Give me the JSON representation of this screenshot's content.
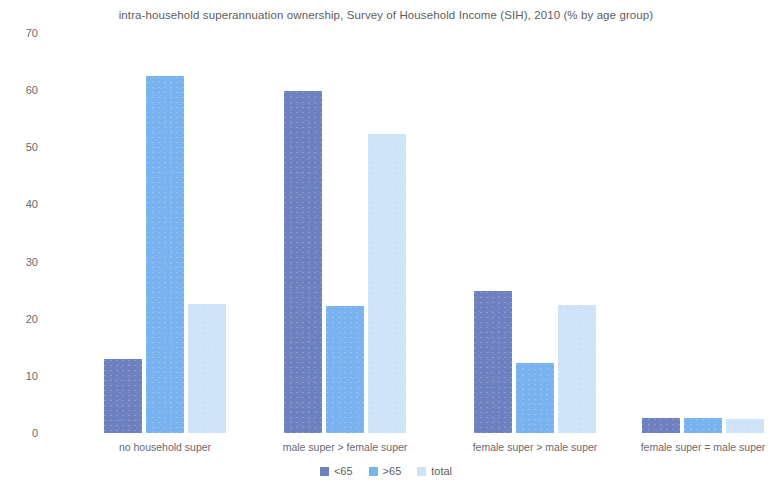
{
  "chart_data": {
    "type": "bar",
    "title": "intra-household superannuation ownership, Survey of Household Income (SIH), 2010 (% by age group)",
    "xlabel": "",
    "ylabel": "",
    "ylim": [
      0,
      70
    ],
    "yticks": [
      70,
      60,
      50,
      40,
      30,
      20,
      10,
      0
    ],
    "grid": false,
    "legend_position": "bottom-center",
    "categories": [
      "no household super",
      "male super > female super",
      "female super > male super",
      "female super = male super"
    ],
    "series": [
      {
        "name": "<65",
        "color": "#6d80c0",
        "values": [
          13.0,
          59.8,
          24.9,
          2.6
        ]
      },
      {
        "name": ">65",
        "color": "#78b2ef",
        "values": [
          62.5,
          22.2,
          12.3,
          2.6
        ]
      },
      {
        "name": "total",
        "color": "#cde4f8",
        "values": [
          22.6,
          52.4,
          22.4,
          2.4
        ]
      }
    ]
  },
  "legend": {
    "items": [
      {
        "label": "<65",
        "swatch": "legend-swatch-dark-blue"
      },
      {
        "label": ">65",
        "swatch": "legend-swatch-medium-blue"
      },
      {
        "label": "total",
        "swatch": "legend-swatch-light-blue"
      }
    ]
  },
  "colors": {
    "series_lt65": "#6d80c0",
    "series_gt65": "#78b2ef",
    "series_total": "#cde4f8",
    "text": "#5d5d60",
    "background": "#ffffff"
  }
}
